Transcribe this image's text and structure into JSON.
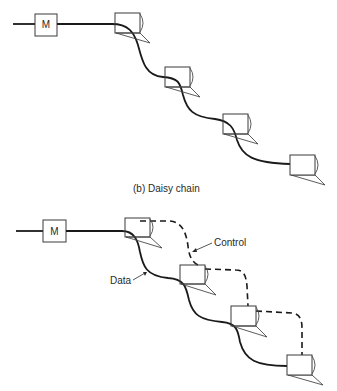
{
  "figure_b": {
    "caption": "(b)  Daisy chain",
    "master_label": "M",
    "drive_count": 4
  },
  "figure_c": {
    "master_label": "M",
    "drive_count": 4,
    "labels": {
      "control": "Control",
      "data": "Data"
    }
  }
}
